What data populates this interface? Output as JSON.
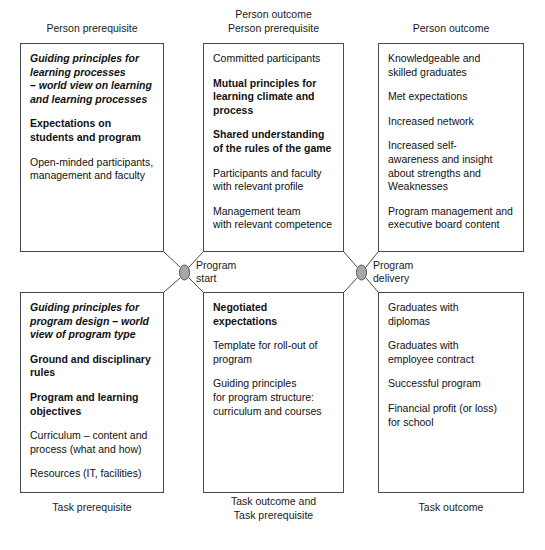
{
  "diagram": {
    "node_fill": "#a8a8a8",
    "node_stroke": "#555555",
    "box_stroke": "#4a4a4a",
    "line_stroke": "#4a4a4a"
  },
  "captions": {
    "top_left": "Person prerequisite",
    "top_middle": "Person outcome\nPerson prerequisite",
    "top_right": "Person outcome",
    "bottom_left": "Task prerequisite",
    "bottom_middle": "Task outcome and\nTask prerequisite",
    "bottom_right": "Task outcome"
  },
  "nodes": {
    "program_start": "Program\nstart",
    "program_delivery": "Program\ndelivery"
  },
  "boxes": {
    "top_left": {
      "name": "person-prerequisite-box",
      "paragraphs": [
        {
          "text": "Guiding principles for\nlearning processes\n– world view on learning\nand  learning processes",
          "style": "bi"
        },
        {
          "text": "Expectations on\nstudents and program",
          "style": "b"
        },
        {
          "text": "Open-minded participants,\nmanagement and faculty",
          "style": "n"
        }
      ]
    },
    "top_middle": {
      "name": "person-outcome-prerequisite-box",
      "paragraphs": [
        {
          "text": "Committed participants",
          "style": "n"
        },
        {
          "text": "Mutual principles for\nlearning climate and\nprocess",
          "style": "b"
        },
        {
          "text": "Shared understanding\nof the rules of the game",
          "style": "b"
        },
        {
          "text": "Participants and faculty\nwith relevant profile",
          "style": "n"
        },
        {
          "text": "Management team\nwith relevant competence",
          "style": "n"
        }
      ]
    },
    "top_right": {
      "name": "person-outcome-box",
      "paragraphs": [
        {
          "text": "Knowledgeable and\nskilled graduates",
          "style": "n"
        },
        {
          "text": "Met expectations",
          "style": "n"
        },
        {
          "text": "Increased network",
          "style": "n"
        },
        {
          "text": "Increased self-\nawareness and insight\nabout strengths and\nWeaknesses",
          "style": "n"
        },
        {
          "text": "Program management and\nexecutive board content",
          "style": "n"
        }
      ]
    },
    "bottom_left": {
      "name": "task-prerequisite-box",
      "paragraphs": [
        {
          "text": "Guiding principles for\nprogram design – world\nview of program type",
          "style": "bi"
        },
        {
          "text": "Ground and disciplinary\nrules",
          "style": "b"
        },
        {
          "text": "Program and learning\nobjectives",
          "style": "b"
        },
        {
          "text": "Curriculum – content and\nprocess (what and how)",
          "style": "n"
        },
        {
          "text": "Resources (IT, facilities)",
          "style": "n"
        }
      ]
    },
    "bottom_middle": {
      "name": "task-outcome-prerequisite-box",
      "paragraphs": [
        {
          "text": "Negotiated expectations",
          "style": "b"
        },
        {
          "text": "Template for roll-out of\nprogram",
          "style": "n"
        },
        {
          "text": "Guiding principles\nfor program structure:\ncurriculum and courses",
          "style": "n"
        }
      ]
    },
    "bottom_right": {
      "name": "task-outcome-box",
      "paragraphs": [
        {
          "text": "Graduates with\ndiplomas",
          "style": "n"
        },
        {
          "text": "Graduates with\nemployee contract",
          "style": "n"
        },
        {
          "text": "Successful program",
          "style": "n"
        },
        {
          "text": "Financial profit (or loss)\nfor school",
          "style": "n"
        }
      ]
    }
  }
}
